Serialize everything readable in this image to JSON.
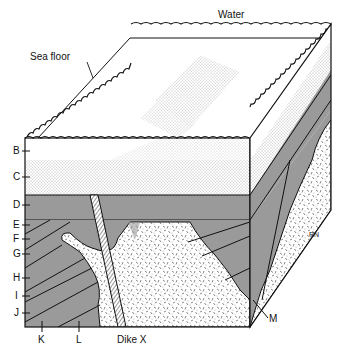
{
  "figure": {
    "type": "geologic-block-diagram",
    "labels": {
      "water": "Water",
      "sea_floor": "Sea floor",
      "layers": [
        "B",
        "C",
        "D",
        "E",
        "F",
        "G",
        "H",
        "I",
        "J"
      ],
      "bottom": [
        "K",
        "L",
        "Dike X"
      ],
      "intrusion_mark": "M",
      "side_label": "RN"
    },
    "colors": {
      "shale_gray": "#9a9a9a",
      "outline": "#111111",
      "background": "#ffffff"
    }
  }
}
